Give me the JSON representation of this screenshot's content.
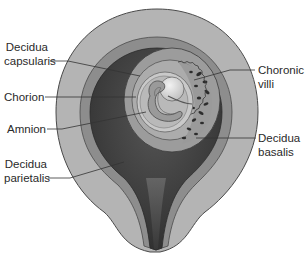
{
  "diagram": {
    "title": "",
    "colors": {
      "background": "#ffffff",
      "decidua_parietalis": "#b3b3b3",
      "decidua_capsularis": "#8c8c8c",
      "uterine_cavity": "#3d3d3d",
      "chorion": "#a8a8a8",
      "amnion": "#cfcfcf",
      "embryo": "#9a9a9a",
      "yolk_sac": "#dedede",
      "outline": "#4a4a4a",
      "leader_line": "#333333",
      "label_text": "#2a2a2a"
    },
    "labels": {
      "decidua_capsularis": {
        "line1": "Decidua",
        "line2": "capsularis"
      },
      "chorion": {
        "line1": "Chorion"
      },
      "amnion": {
        "line1": "Amnion"
      },
      "decidua_parietalis": {
        "line1": "Decidua",
        "line2": "parietalis"
      },
      "chorionic_villi": {
        "line1": "Choronic",
        "line2": "villi"
      },
      "decidua_basalis": {
        "line1": "Decidua",
        "line2": "basalis"
      }
    }
  }
}
